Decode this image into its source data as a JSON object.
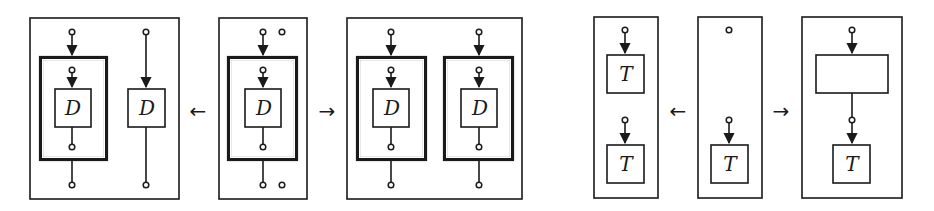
{
  "diagram": {
    "left_group": {
      "arrows": [
        {
          "id": "arrow-left-1",
          "glyph": "←",
          "x": 198,
          "y": 111
        },
        {
          "id": "arrow-right-1",
          "glyph": "→",
          "x": 327,
          "y": 111
        }
      ],
      "panels": [
        {
          "id": "panel-D-split",
          "label": "D",
          "label2": "D"
        },
        {
          "id": "panel-D-source",
          "label": "D"
        },
        {
          "id": "panel-D-duplicate",
          "label": "D",
          "label2": "D"
        }
      ]
    },
    "right_group": {
      "arrows": [
        {
          "id": "arrow-left-2",
          "glyph": "←",
          "x": 678,
          "y": 111
        },
        {
          "id": "arrow-right-2",
          "glyph": "→",
          "x": 781,
          "y": 111
        }
      ],
      "panels": [
        {
          "id": "panel-T-stacked",
          "label": "T",
          "label2": "T"
        },
        {
          "id": "panel-T-source",
          "label": "T"
        },
        {
          "id": "panel-T-composed",
          "label": "T",
          "empty_box_label": ""
        }
      ]
    },
    "colors": {
      "ink": "#1a1a1a",
      "background": "#ffffff"
    }
  }
}
